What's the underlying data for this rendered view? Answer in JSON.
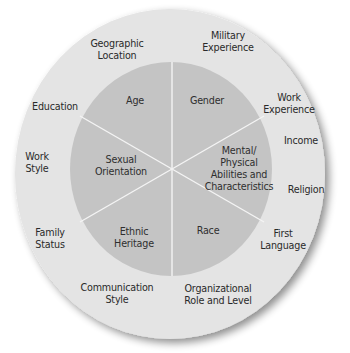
{
  "diagram": {
    "title": "",
    "colors": {
      "background": "#ffffff",
      "outer_ring": "#e4e4e4",
      "inner_circle": "#c4c4c4",
      "divider": "#f4f4f4",
      "text": "#2a2a2a",
      "shadow": "#9a9a9a"
    },
    "inner_dimensions": [
      {
        "label": "Age",
        "x": 135,
        "y": 101
      },
      {
        "label": "Gender",
        "x": 207,
        "y": 101
      },
      {
        "label": "Sexual\nOrientation",
        "x": 121,
        "y": 166
      },
      {
        "label": "Mental/\nPhysical\nAbilities and\nCharacteristics",
        "x": 239,
        "y": 169
      },
      {
        "label": "Ethnic\nHeritage",
        "x": 134,
        "y": 238
      },
      {
        "label": "Race",
        "x": 208,
        "y": 231
      }
    ],
    "outer_dimensions": [
      {
        "label": "Geographic\nLocation",
        "x": 117,
        "y": 50
      },
      {
        "label": "Military\nExperience",
        "x": 228,
        "y": 42
      },
      {
        "label": "Education",
        "x": 55,
        "y": 107
      },
      {
        "label": "Work\nExperience",
        "x": 289,
        "y": 104
      },
      {
        "label": "Income",
        "x": 301,
        "y": 141
      },
      {
        "label": "Work\nStyle",
        "x": 37,
        "y": 163
      },
      {
        "label": "Religion",
        "x": 306,
        "y": 190
      },
      {
        "label": "Family\nStatus",
        "x": 50,
        "y": 239
      },
      {
        "label": "First\nLanguage",
        "x": 283,
        "y": 240
      },
      {
        "label": "Communication\nStyle",
        "x": 117,
        "y": 294
      },
      {
        "label": "Organizational\nRole and Level",
        "x": 218,
        "y": 295
      }
    ]
  }
}
